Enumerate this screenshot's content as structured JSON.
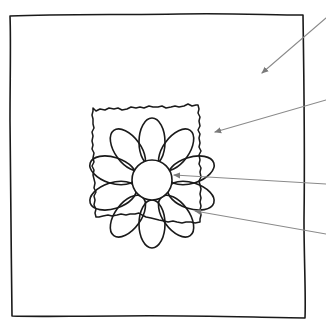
{
  "diagram": {
    "type": "labeled-illustration",
    "style": "hand-drawn line art",
    "colors": {
      "background": "#ffffff",
      "ink": "#1a1a1a",
      "leader": "#8a8a8a"
    },
    "parts": [
      {
        "id": "frame",
        "label": "",
        "description": "outer square frame / border"
      },
      {
        "id": "mat",
        "label": "",
        "description": "rough torn-edge paper square"
      },
      {
        "id": "petals",
        "label": "",
        "description": "ten rounded petals"
      },
      {
        "id": "center",
        "label": "",
        "description": "circular flower centre"
      }
    ],
    "leaders": [
      {
        "target": "frame",
        "label": "",
        "from": [
          326,
          18
        ],
        "to": [
          260,
          75
        ]
      },
      {
        "target": "mat",
        "label": "",
        "from": [
          326,
          100
        ],
        "to": [
          213,
          133
        ]
      },
      {
        "target": "center",
        "label": "",
        "from": [
          326,
          184
        ],
        "to": [
          172,
          175
        ]
      },
      {
        "target": "petals",
        "label": "",
        "from": [
          326,
          234
        ],
        "to": [
          193,
          211
        ]
      }
    ],
    "note": "leader labels fall outside the visible crop (right edge); no text is rendered"
  }
}
